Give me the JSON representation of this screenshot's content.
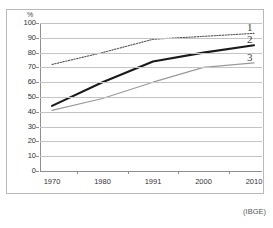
{
  "caption_strip": "",
  "axis": {
    "y_unit_label": "%",
    "y_ticks": [
      "100",
      "90",
      "80",
      "70",
      "60",
      "50",
      "40",
      "30",
      "20",
      "10",
      "0"
    ],
    "x_ticks": [
      "1970",
      "1980",
      "1991",
      "2000",
      "2010"
    ]
  },
  "series_labels": {
    "one": "1",
    "two": "2",
    "three": "3"
  },
  "source": {
    "text": "(IBGE)"
  },
  "colors": {
    "series1": "#555555",
    "series2": "#1a1a1a",
    "series3": "#9a9a9a",
    "gridline": "#c4c4c4",
    "axis": "#8f8f8f",
    "frame": "#b9b9b9",
    "background": "#ffffff"
  },
  "chart_data": {
    "type": "line",
    "title": "",
    "subtitle": "",
    "xlabel": "",
    "ylabel": "%",
    "categories": [
      "1970",
      "1980",
      "1991",
      "2000",
      "2010"
    ],
    "x": [
      1970,
      1980,
      1991,
      2000,
      2010
    ],
    "ylim": [
      0,
      100
    ],
    "y_ticks": [
      0,
      10,
      20,
      30,
      40,
      50,
      60,
      70,
      80,
      90,
      100
    ],
    "grid": true,
    "legend_position": "right-inline-labels",
    "series": [
      {
        "name": "1",
        "label": "1",
        "style": "dotted",
        "color": "#555555",
        "values": [
          72,
          80,
          89,
          91,
          93
        ]
      },
      {
        "name": "2",
        "label": "2",
        "style": "solid-bold",
        "color": "#1a1a1a",
        "values": [
          44,
          60,
          74,
          80,
          85
        ]
      },
      {
        "name": "3",
        "label": "3",
        "style": "solid-thin",
        "color": "#9a9a9a",
        "values": [
          41,
          49,
          60,
          70,
          73
        ]
      }
    ],
    "annotations": [
      "(IBGE)"
    ]
  }
}
